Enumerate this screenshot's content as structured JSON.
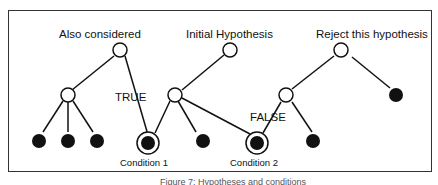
{
  "diagram": {
    "labels": {
      "also_considered": "Also considered",
      "initial_hypothesis": "Initial Hypothesis",
      "reject": "Reject this hypothesis",
      "true_label": "TRUE",
      "false_label": "FALSE",
      "condition1": "Condition 1",
      "condition2": "Condition 2"
    },
    "caption": "Figure 7: Hypotheses and conditions"
  }
}
